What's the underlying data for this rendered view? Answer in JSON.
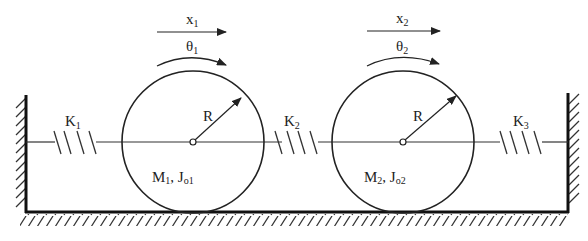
{
  "diagram": {
    "type": "two-mass rolling cylinder spring system",
    "springs": [
      {
        "id": "K1",
        "label": "K",
        "sub": "1"
      },
      {
        "id": "K2",
        "label": "K",
        "sub": "2"
      },
      {
        "id": "K3",
        "label": "K",
        "sub": "3"
      }
    ],
    "cylinders": [
      {
        "displacement": {
          "label": "x",
          "sub": "1"
        },
        "rotation": {
          "label": "θ",
          "sub": "1"
        },
        "radius_label": "R",
        "mass_label": {
          "m": "M",
          "m_sub": "1",
          "sep": ", ",
          "j": "J",
          "j_sub": "o1"
        }
      },
      {
        "displacement": {
          "label": "x",
          "sub": "2"
        },
        "rotation": {
          "label": "θ",
          "sub": "2"
        },
        "radius_label": "R",
        "mass_label": {
          "m": "M",
          "m_sub": "2",
          "sep": ", ",
          "j": "J",
          "j_sub": "o2"
        }
      }
    ],
    "colors": {
      "line": "#222222",
      "background": "#ffffff"
    }
  }
}
